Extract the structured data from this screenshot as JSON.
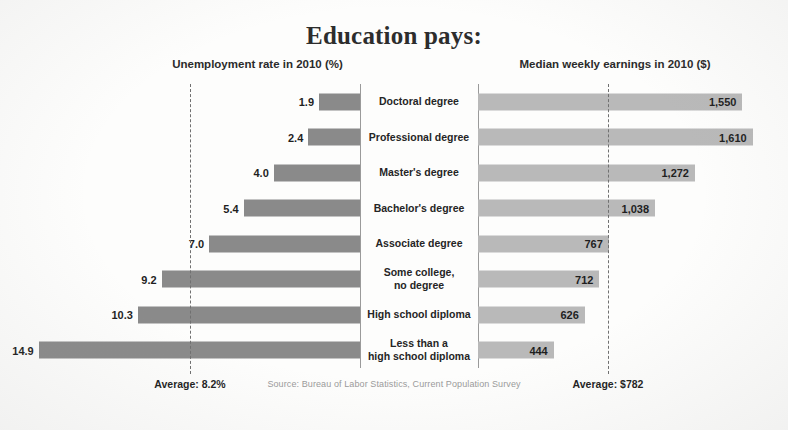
{
  "title": "Education pays:",
  "headers": {
    "left": "Unemployment rate in 2010 (%)",
    "right": "Median weekly earnings in 2010 ($)"
  },
  "averages": {
    "unemployment_label": "Average: 8.2%",
    "earnings_label": "Average: $782",
    "unemployment_value": 8.2,
    "earnings_value": 782
  },
  "source": "Source: Bureau of Labor Statistics, Current Population Survey",
  "colors": {
    "unemployment_bar": "#8a8a8a",
    "earnings_bar": "#b9b9b9",
    "average_line": "#707070",
    "text": "#1f1f1f",
    "background": "#fdfdfc"
  },
  "rows": [
    {
      "category": "Doctoral degree",
      "unemployment": "1.9",
      "earnings": "1,550",
      "unemployment_value": 1.9,
      "earnings_value": 1550
    },
    {
      "category": "Professional degree",
      "unemployment": "2.4",
      "earnings": "1,610",
      "unemployment_value": 2.4,
      "earnings_value": 1610
    },
    {
      "category": "Master's degree",
      "unemployment": "4.0",
      "earnings": "1,272",
      "unemployment_value": 4.0,
      "earnings_value": 1272
    },
    {
      "category": "Bachelor's degree",
      "unemployment": "5.4",
      "earnings": "1,038",
      "unemployment_value": 5.4,
      "earnings_value": 1038
    },
    {
      "category": "Associate degree",
      "unemployment": "7.0",
      "earnings": "767",
      "unemployment_value": 7.0,
      "earnings_value": 767
    },
    {
      "category": "Some college,\nno degree",
      "unemployment": "9.2",
      "earnings": "712",
      "unemployment_value": 9.2,
      "earnings_value": 712
    },
    {
      "category": "High school diploma",
      "unemployment": "10.3",
      "earnings": "626",
      "unemployment_value": 10.3,
      "earnings_value": 626
    },
    {
      "category": "Less than a\nhigh school diploma",
      "unemployment": "14.9",
      "earnings": "444",
      "unemployment_value": 14.9,
      "earnings_value": 444
    }
  ],
  "chart_data": {
    "type": "bar",
    "title": "Education pays:",
    "subtitle": "",
    "orientation": "horizontal-bidirectional",
    "categories": [
      "Doctoral degree",
      "Professional degree",
      "Master's degree",
      "Bachelor's degree",
      "Associate degree",
      "Some college, no degree",
      "High school diploma",
      "Less than a high school diploma"
    ],
    "series": [
      {
        "name": "Unemployment rate in 2010 (%)",
        "direction": "left",
        "values": [
          1.9,
          2.4,
          4.0,
          5.4,
          7.0,
          9.2,
          10.3,
          14.9
        ],
        "unit": "%",
        "xlim": [
          0,
          16
        ],
        "reference_line": 8.2,
        "reference_label": "Average: 8.2%",
        "color": "#8a8a8a"
      },
      {
        "name": "Median weekly earnings in 2010 ($)",
        "direction": "right",
        "values": [
          1550,
          1610,
          1272,
          1038,
          767,
          712,
          626,
          444
        ],
        "unit": "$",
        "xlim": [
          0,
          1700
        ],
        "reference_line": 782,
        "reference_label": "Average: $782",
        "color": "#b9b9b9"
      }
    ],
    "xlabel": "",
    "ylabel": "",
    "grid": false,
    "legend": "none",
    "annotations": [
      "Average: 8.2%",
      "Average: $782",
      "Source: Bureau of Labor Statistics, Current Population Survey"
    ]
  }
}
